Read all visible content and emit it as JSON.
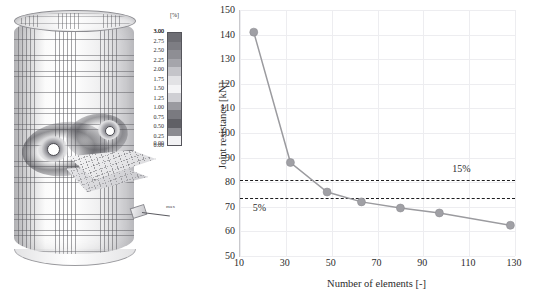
{
  "figure": {
    "left_panel": {
      "name": "fem-contour-plot",
      "description": "Finite element mesh of tubular joint with plastic strain contour",
      "annotation_tag": "max",
      "legend": {
        "unit": "[%]",
        "max_label": "3.00",
        "min_label": "0.00",
        "ticks": [
          "3.00",
          "2.75",
          "2.50",
          "2.25",
          "2.00",
          "1.75",
          "1.50",
          "1.25",
          "1.00",
          "0.75",
          "0.50",
          "0.25",
          "0.00"
        ],
        "colors": [
          "#6e6e74",
          "#7d7d83",
          "#8e8e94",
          "#a5a5ab",
          "#c4c4c9",
          "#e2e2e5",
          "#f4f4f6",
          "#cfcfd4",
          "#9a9aa0",
          "#7a7a80",
          "#606066",
          "#8a8a90",
          "#f2f2f4"
        ]
      }
    },
    "chart_data": {
      "type": "line",
      "title": "",
      "xlabel": "Number of elements [-]",
      "ylabel": "Joint resistance [kN]",
      "xlim": [
        10,
        130
      ],
      "ylim": [
        50,
        150
      ],
      "xticks": [
        10,
        30,
        50,
        70,
        90,
        110,
        130
      ],
      "yticks": [
        50,
        60,
        70,
        80,
        90,
        100,
        110,
        120,
        130,
        140,
        150
      ],
      "grid": true,
      "legend_position": "none",
      "series": [
        {
          "name": "Joint resistance",
          "x": [
            16,
            32,
            48,
            63,
            80,
            97,
            128
          ],
          "values": [
            141,
            88,
            76,
            72,
            69.5,
            67.5,
            62.5
          ],
          "color": "#9b9b9f",
          "marker": "circle"
        }
      ],
      "annotations": [
        {
          "name": "threshold-15",
          "label": "15%",
          "y": 81,
          "style": "dashed",
          "color": "#1d1d1f"
        },
        {
          "name": "threshold-5",
          "label": "5%",
          "y": 73.5,
          "style": "dashed",
          "color": "#1d1d1f"
        }
      ]
    }
  }
}
